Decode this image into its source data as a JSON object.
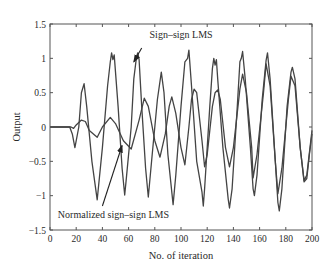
{
  "chart_data": {
    "type": "line",
    "title": "",
    "xlabel": "No. of iteration",
    "ylabel": "Output",
    "xlim": [
      0,
      200
    ],
    "ylim": [
      -1.5,
      1.5
    ],
    "xticks": [
      0,
      20,
      40,
      60,
      80,
      100,
      120,
      140,
      160,
      180,
      200
    ],
    "xtick_labels": [
      "0",
      "20",
      "40",
      "60",
      "80",
      "100",
      "120",
      "140",
      "160",
      "180",
      "200"
    ],
    "yticks": [
      -1.5,
      -1,
      -0.5,
      0,
      0.5,
      1,
      1.5
    ],
    "ytick_labels": [
      "−1.5",
      "−1",
      "−0.5",
      "0",
      "0.5",
      "1",
      "1.5"
    ],
    "grid": false,
    "legend": "none (inline annotations with arrows)",
    "series": [
      {
        "name": "Sign–sign LMS",
        "color": "#444444",
        "points": [
          [
            0,
            0
          ],
          [
            15,
            0
          ],
          [
            17,
            -0.1
          ],
          [
            19,
            -0.3
          ],
          [
            22,
            0
          ],
          [
            24,
            0.5
          ],
          [
            26,
            0.63
          ],
          [
            28,
            0.3
          ],
          [
            32,
            -0.5
          ],
          [
            36,
            -1.06
          ],
          [
            40,
            -0.3
          ],
          [
            44,
            0.6
          ],
          [
            46,
            0.95
          ],
          [
            47,
            1.08
          ],
          [
            48,
            0.98
          ],
          [
            49,
            1.05
          ],
          [
            52,
            0.3
          ],
          [
            55,
            -0.6
          ],
          [
            57,
            -0.99
          ],
          [
            58,
            -0.8
          ],
          [
            62,
            0
          ],
          [
            64,
            0.7
          ],
          [
            66,
            1.02
          ],
          [
            67,
            1.08
          ],
          [
            68,
            0.98
          ],
          [
            70,
            0.3
          ],
          [
            73,
            -0.6
          ],
          [
            75,
            -1.02
          ],
          [
            78,
            -0.4
          ],
          [
            82,
            0.4
          ],
          [
            85,
            0.8
          ],
          [
            87,
            0.5
          ],
          [
            90,
            -0.4
          ],
          [
            94,
            -1.13
          ],
          [
            96,
            -0.7
          ],
          [
            100,
            0.3
          ],
          [
            103,
            0.95
          ],
          [
            105,
            1.0
          ],
          [
            106,
            1.12
          ],
          [
            108,
            0.6
          ],
          [
            112,
            -0.5
          ],
          [
            116,
            -0.95
          ],
          [
            117,
            -1.15
          ],
          [
            118,
            -0.9
          ],
          [
            122,
            0.3
          ],
          [
            124,
            0.85
          ],
          [
            125,
            1.0
          ],
          [
            126,
            0.9
          ],
          [
            127,
            0.98
          ],
          [
            128,
            0.7
          ],
          [
            132,
            -0.3
          ],
          [
            136,
            -1.05
          ],
          [
            137,
            -1.18
          ],
          [
            139,
            -0.9
          ],
          [
            143,
            0.3
          ],
          [
            145,
            0.95
          ],
          [
            146,
            1.0
          ],
          [
            147,
            1.1
          ],
          [
            149,
            0.7
          ],
          [
            153,
            -0.3
          ],
          [
            155,
            -0.9
          ],
          [
            156,
            -1.0
          ],
          [
            158,
            -0.7
          ],
          [
            162,
            0.4
          ],
          [
            165,
            0.97
          ],
          [
            166,
            1.08
          ],
          [
            168,
            0.7
          ],
          [
            172,
            -0.5
          ],
          [
            174,
            -1.1
          ],
          [
            175,
            -1.22
          ],
          [
            177,
            -0.9
          ],
          [
            181,
            0.3
          ],
          [
            184,
            0.8
          ],
          [
            185,
            0.87
          ],
          [
            187,
            0.7
          ],
          [
            191,
            -0.3
          ],
          [
            194,
            -0.8
          ],
          [
            196,
            -0.75
          ],
          [
            198,
            -0.4
          ],
          [
            200,
            -0.1
          ]
        ]
      },
      {
        "name": "Normalized sign–sign LMS",
        "color": "#444444",
        "points": [
          [
            0,
            0
          ],
          [
            16,
            0
          ],
          [
            18,
            -0.02
          ],
          [
            20,
            0.03
          ],
          [
            24,
            0.1
          ],
          [
            27,
            0.08
          ],
          [
            30,
            -0.05
          ],
          [
            36,
            -0.15
          ],
          [
            40,
            0
          ],
          [
            46,
            0.14
          ],
          [
            50,
            0.05
          ],
          [
            56,
            -0.2
          ],
          [
            62,
            -0.32
          ],
          [
            68,
            0.1
          ],
          [
            72,
            0.42
          ],
          [
            75,
            0.3
          ],
          [
            80,
            -0.2
          ],
          [
            84,
            -0.44
          ],
          [
            88,
            -0.1
          ],
          [
            91,
            0.3
          ],
          [
            93,
            0.44
          ],
          [
            96,
            0.2
          ],
          [
            100,
            -0.3
          ],
          [
            103,
            -0.55
          ],
          [
            106,
            0
          ],
          [
            108,
            0.4
          ],
          [
            110,
            0.55
          ],
          [
            112,
            0.5
          ],
          [
            116,
            -0.2
          ],
          [
            118,
            -0.58
          ],
          [
            120,
            -0.4
          ],
          [
            124,
            0.3
          ],
          [
            126,
            0.5
          ],
          [
            128,
            0.54
          ],
          [
            130,
            0.4
          ],
          [
            134,
            -0.3
          ],
          [
            137,
            -0.58
          ],
          [
            140,
            -0.3
          ],
          [
            145,
            0.55
          ],
          [
            147,
            0.77
          ],
          [
            150,
            0.5
          ],
          [
            154,
            -0.3
          ],
          [
            155,
            -0.74
          ],
          [
            158,
            -0.4
          ],
          [
            163,
            0.5
          ],
          [
            165,
            0.92
          ],
          [
            168,
            0.6
          ],
          [
            172,
            -0.5
          ],
          [
            174,
            -0.97
          ],
          [
            177,
            -0.6
          ],
          [
            182,
            0.4
          ],
          [
            184,
            0.74
          ],
          [
            187,
            0.6
          ],
          [
            191,
            -0.3
          ],
          [
            194,
            -0.78
          ],
          [
            196,
            -0.7
          ],
          [
            200,
            -0.05
          ]
        ]
      }
    ],
    "annotations": [
      {
        "text": "Sign–sign LMS",
        "text_at": [
          76,
          1.3
        ],
        "arrow_from": [
          70,
          1.15
        ],
        "arrow_to": [
          64,
          0.95
        ]
      },
      {
        "text": "Normalized sign–sign LMS",
        "text_at": [
          6,
          -1.32
        ],
        "arrow_from": [
          40,
          -1.15
        ],
        "arrow_to": [
          55,
          -0.27
        ]
      }
    ]
  }
}
